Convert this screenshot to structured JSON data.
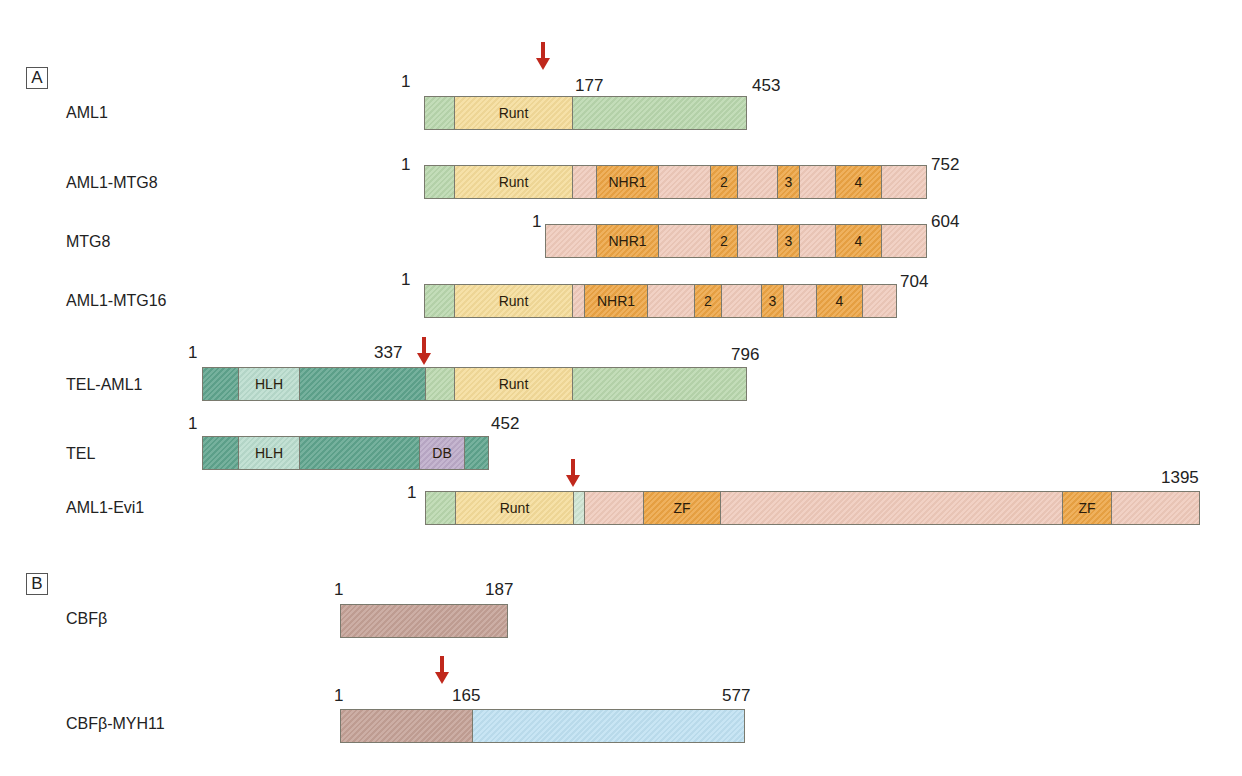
{
  "colors": {
    "aml1_green": "#b9d7ad",
    "runt_yellow": "#f5dc9a",
    "mtg_pink": "#efcabb",
    "nhr_orange": "#eca444",
    "tel_teal": "#5fa48d",
    "hlh_light": "#b9dccd",
    "db_purple": "#bcaac8",
    "cbfb_brown": "#c4a196",
    "myh11_blue": "#bfe1f2",
    "evi_light": "#cfe5d3",
    "arrow_red": "#c0281c"
  },
  "panels": [
    {
      "label": "A"
    },
    {
      "label": "B"
    }
  ],
  "proteins": [
    {
      "name": "AML1",
      "start": "1",
      "end": "453",
      "mark": "177"
    },
    {
      "name": "AML1-MTG8",
      "start": "1",
      "end": "752"
    },
    {
      "name": "MTG8",
      "start": "1",
      "end": "604"
    },
    {
      "name": "AML1-MTG16",
      "start": "1",
      "end": "704"
    },
    {
      "name": "TEL-AML1",
      "start": "1",
      "end": "796",
      "mark": "337"
    },
    {
      "name": "TEL",
      "start": "1",
      "end": "452"
    },
    {
      "name": "AML1-Evi1",
      "start": "1",
      "end": "1395"
    },
    {
      "name": "CBFβ",
      "start": "1",
      "end": "187"
    },
    {
      "name": "CBFβ-MYH11",
      "start": "1",
      "end": "577",
      "mark": "165"
    }
  ],
  "domains": {
    "runt": "Runt",
    "nhr1": "NHR1",
    "nhr2": "2",
    "nhr3": "3",
    "nhr4": "4",
    "hlh": "HLH",
    "db": "DB",
    "zf": "ZF"
  }
}
